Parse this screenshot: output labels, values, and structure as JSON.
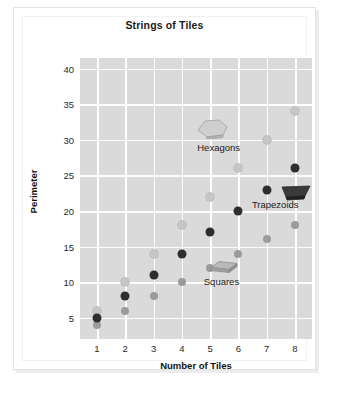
{
  "figure": {
    "title": "Strings of Tiles",
    "caption": ""
  },
  "axes": {
    "x_label": "Number of Tiles",
    "y_label": "Perimeter",
    "x_ticks": [
      "1",
      "2",
      "3",
      "4",
      "5",
      "6",
      "7",
      "8"
    ],
    "y_ticks": [
      "5",
      "10",
      "15",
      "20",
      "25",
      "30",
      "35",
      "40"
    ]
  },
  "series_labels": {
    "hexagons": "Hexagons",
    "trapezoids": "Trapezoids",
    "squares": "Squares"
  },
  "glyph_names": {
    "hexagons": "hexagon-tile-glyph",
    "trapezoids": "trapezoid-tile-glyph",
    "squares": "square-tile-glyph"
  },
  "colors": {
    "plot_background": "#dadada",
    "gridline": "#fdfdfd",
    "hexagons": "#c6c6c6",
    "trapezoids": "#2e2e2e",
    "squares": "#9b9b9b",
    "card_background": "#ffffff",
    "card_border": "#e3e3e3",
    "text": "#1a1a1a"
  },
  "chart_data": {
    "type": "scatter",
    "title": "Strings of Tiles",
    "xlabel": "Number of Tiles",
    "ylabel": "Perimeter",
    "x": [
      1,
      2,
      3,
      4,
      5,
      6,
      7,
      8
    ],
    "xlim": [
      0.4,
      8.6
    ],
    "ylim": [
      2,
      41.5
    ],
    "xticks": [
      1,
      2,
      3,
      4,
      5,
      6,
      7,
      8
    ],
    "yticks": [
      5,
      10,
      15,
      20,
      25,
      30,
      35,
      40
    ],
    "grid": true,
    "legend": "inline-annotations",
    "series": [
      {
        "name": "Hexagons",
        "color": "#c6c6c6",
        "values": [
          6,
          10,
          14,
          18,
          22,
          26,
          30,
          34
        ]
      },
      {
        "name": "Trapezoids",
        "color": "#2e2e2e",
        "values": [
          5,
          8,
          11,
          14,
          17,
          20,
          23,
          26
        ]
      },
      {
        "name": "Squares",
        "color": "#9b9b9b",
        "values": [
          4,
          6,
          8,
          10,
          12,
          14,
          16,
          18
        ]
      }
    ],
    "annotations": [
      {
        "text": "Hexagons",
        "x": 5.3,
        "y": 29.0
      },
      {
        "text": "Trapezoids",
        "x": 7.3,
        "y": 21.0
      },
      {
        "text": "Squares",
        "x": 5.4,
        "y": 10.2
      }
    ]
  }
}
